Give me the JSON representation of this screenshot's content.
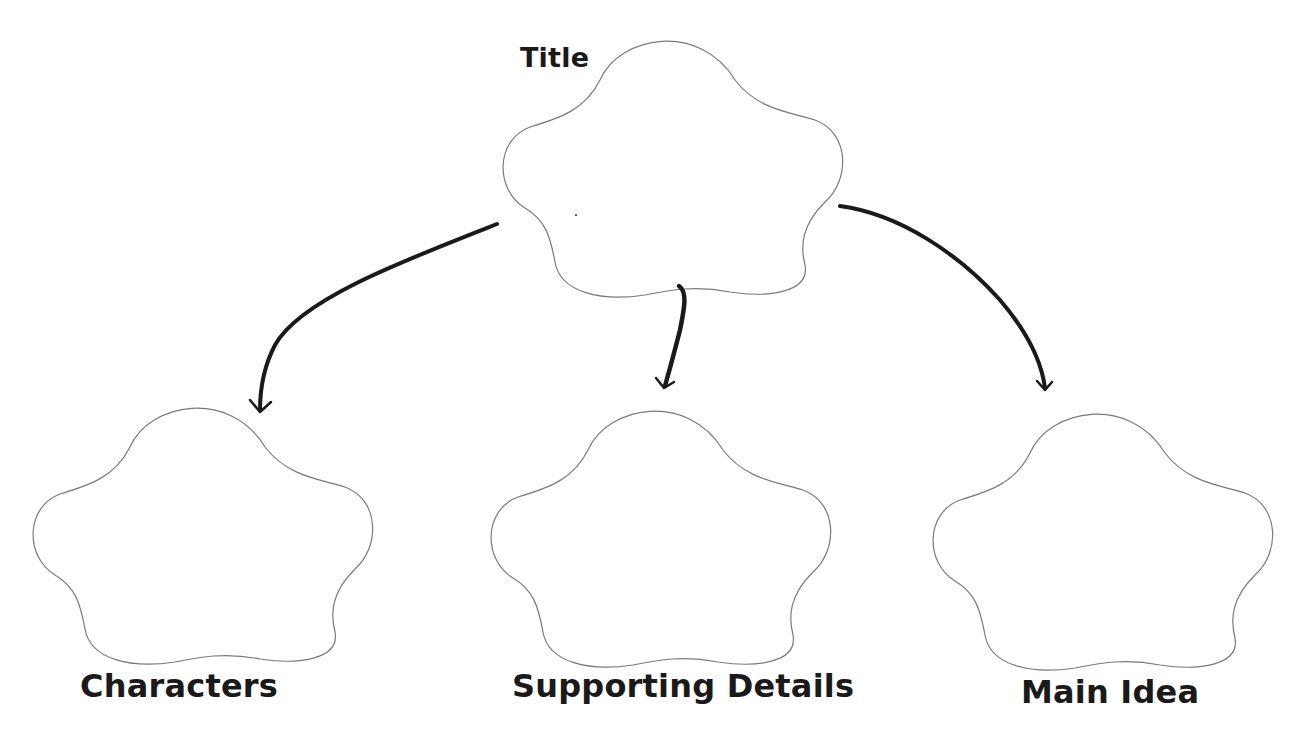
{
  "diagram": {
    "type": "graphic-organizer",
    "nodes": [
      {
        "id": "title",
        "label": "Title",
        "content": ""
      },
      {
        "id": "characters",
        "label": "Characters",
        "content": ""
      },
      {
        "id": "supporting_details",
        "label": "Supporting Details",
        "content": ""
      },
      {
        "id": "main_idea",
        "label": "Main Idea",
        "content": ""
      }
    ],
    "edges": [
      {
        "from": "title",
        "to": "characters"
      },
      {
        "from": "title",
        "to": "supporting_details"
      },
      {
        "from": "title",
        "to": "main_idea"
      }
    ],
    "colors": {
      "outline": "#7a7a7a",
      "arrow": "#1a1a1a",
      "text": "#1a1a1a",
      "background": "#ffffff"
    }
  }
}
